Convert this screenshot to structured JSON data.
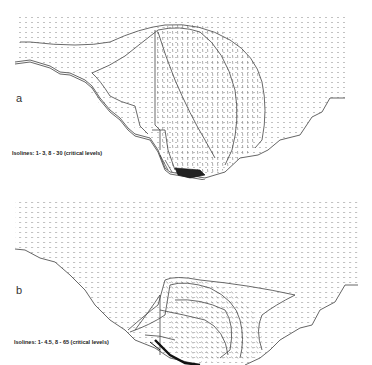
{
  "figure": {
    "panels": [
      {
        "id": "a",
        "label": "a",
        "caption": "Isolines: 1- 3,  8 - 30 (critical levels)",
        "isoline_levels": {
          "regular": "1- 3",
          "critical": "8 - 30"
        }
      },
      {
        "id": "b",
        "label": "b",
        "caption": "Isolines: 1- 4.5,  8 - 65 (critical levels)",
        "isoline_levels": {
          "regular": "1- 4.5",
          "critical": "8 - 65"
        }
      }
    ],
    "colors": {
      "background": "#ffffff",
      "isoline": "#444444",
      "vector": "#888888",
      "terrain": "#555555",
      "dense": "#111111"
    }
  }
}
